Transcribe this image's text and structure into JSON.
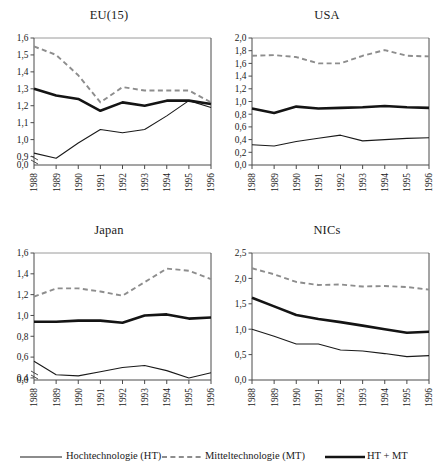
{
  "figure": {
    "panel_count": 4,
    "legend": {
      "position": "bottom",
      "entries": [
        {
          "key": "ht",
          "label": "Hochtechnologie (HT)",
          "style": "thin-solid-black",
          "color": "#1a1a1a"
        },
        {
          "key": "mt",
          "label": "Mitteltechnologie (MT)",
          "style": "dashed-grey",
          "color": "#8d8d8d"
        },
        {
          "key": "sum",
          "label": "HT + MT",
          "style": "thick-solid-black",
          "color": "#141414"
        }
      ]
    }
  },
  "chart_data": [
    {
      "type": "line",
      "title": "EU(15)",
      "xlabel": "",
      "ylabel": "",
      "x": [
        1988,
        1989,
        1990,
        1991,
        1992,
        1993,
        1994,
        1995,
        1996
      ],
      "xticklabels": [
        "1988",
        "1989",
        "1990",
        "1991",
        "1992",
        "1993",
        "1994",
        "1995",
        "1996"
      ],
      "yticklabels": [
        "0,0",
        "0,9",
        "1,0",
        "1,1",
        "1,2",
        "1,3",
        "1,4",
        "1,5",
        "1,6"
      ],
      "ytickvalues": [
        0.0,
        0.9,
        1.0,
        1.1,
        1.2,
        1.3,
        1.4,
        1.5,
        1.6
      ],
      "ylim": [
        0.85,
        1.6
      ],
      "axis_break": true,
      "grid": false,
      "series": [
        {
          "name": "Hochtechnologie (HT)",
          "key": "ht",
          "values": [
            0.92,
            0.89,
            0.98,
            1.06,
            1.04,
            1.06,
            1.14,
            1.23,
            1.19
          ]
        },
        {
          "name": "Mitteltechnologie (MT)",
          "key": "mt",
          "values": [
            1.55,
            1.5,
            1.38,
            1.22,
            1.31,
            1.29,
            1.29,
            1.29,
            1.22
          ]
        },
        {
          "name": "HT + MT",
          "key": "sum",
          "values": [
            1.3,
            1.26,
            1.24,
            1.17,
            1.22,
            1.2,
            1.23,
            1.23,
            1.21
          ]
        }
      ]
    },
    {
      "type": "line",
      "title": "USA",
      "xlabel": "",
      "ylabel": "",
      "x": [
        1988,
        1989,
        1990,
        1991,
        1992,
        1993,
        1994,
        1995,
        1996
      ],
      "xticklabels": [
        "1988",
        "1989",
        "1990",
        "1991",
        "1992",
        "1993",
        "1994",
        "1995",
        "1996"
      ],
      "yticklabels": [
        "0,0",
        "0,2",
        "0,4",
        "0,6",
        "0,8",
        "1,0",
        "1,2",
        "1,4",
        "1,6",
        "1,8",
        "2,0"
      ],
      "ytickvalues": [
        0.0,
        0.2,
        0.4,
        0.6,
        0.8,
        1.0,
        1.2,
        1.4,
        1.6,
        1.8,
        2.0
      ],
      "ylim": [
        0.0,
        2.0
      ],
      "axis_break": false,
      "grid": false,
      "series": [
        {
          "name": "Hochtechnologie (HT)",
          "key": "ht",
          "values": [
            0.32,
            0.3,
            0.37,
            0.42,
            0.47,
            0.38,
            0.4,
            0.42,
            0.43
          ]
        },
        {
          "name": "Mitteltechnologie (MT)",
          "key": "mt",
          "values": [
            1.72,
            1.73,
            1.7,
            1.6,
            1.6,
            1.72,
            1.81,
            1.72,
            1.71
          ]
        },
        {
          "name": "HT + MT",
          "key": "sum",
          "values": [
            0.89,
            0.82,
            0.92,
            0.89,
            0.9,
            0.91,
            0.93,
            0.91,
            0.9
          ]
        }
      ]
    },
    {
      "type": "line",
      "title": "Japan",
      "xlabel": "",
      "ylabel": "",
      "x": [
        1988,
        1989,
        1990,
        1991,
        1992,
        1993,
        1994,
        1995,
        1996
      ],
      "xticklabels": [
        "1988",
        "1989",
        "1990",
        "1991",
        "1992",
        "1993",
        "1994",
        "1995",
        "1996"
      ],
      "yticklabels": [
        "0,0",
        "0,4",
        "0,6",
        "0,8",
        "1,0",
        "1,2",
        "1,4",
        "1,6"
      ],
      "ytickvalues": [
        0.0,
        0.4,
        0.6,
        0.8,
        1.0,
        1.2,
        1.4,
        1.6
      ],
      "ylim": [
        0.38,
        1.6
      ],
      "axis_break": true,
      "grid": false,
      "series": [
        {
          "name": "Hochtechnologie (HT)",
          "key": "ht",
          "values": [
            0.56,
            0.43,
            0.42,
            0.46,
            0.5,
            0.52,
            0.47,
            0.4,
            0.45
          ]
        },
        {
          "name": "Mitteltechnologie (MT)",
          "key": "mt",
          "values": [
            1.18,
            1.26,
            1.26,
            1.23,
            1.19,
            1.32,
            1.45,
            1.43,
            1.35
          ]
        },
        {
          "name": "HT + MT",
          "key": "sum",
          "values": [
            0.94,
            0.94,
            0.95,
            0.95,
            0.93,
            1.0,
            1.01,
            0.97,
            0.98
          ]
        }
      ]
    },
    {
      "type": "line",
      "title": "NICs",
      "xlabel": "",
      "ylabel": "",
      "x": [
        1988,
        1989,
        1990,
        1991,
        1992,
        1993,
        1994,
        1995,
        1996
      ],
      "xticklabels": [
        "1988",
        "1989",
        "1990",
        "1991",
        "1992",
        "1993",
        "1994",
        "1995",
        "1996"
      ],
      "yticklabels": [
        "0,0",
        "0,5",
        "1,0",
        "1,5",
        "2,0",
        "2,5"
      ],
      "ytickvalues": [
        0.0,
        0.5,
        1.0,
        1.5,
        2.0,
        2.5
      ],
      "ylim": [
        0.0,
        2.5
      ],
      "axis_break": false,
      "grid": false,
      "series": [
        {
          "name": "Hochtechnologie (HT)",
          "key": "ht",
          "values": [
            1.0,
            0.86,
            0.71,
            0.71,
            0.59,
            0.57,
            0.52,
            0.46,
            0.48
          ]
        },
        {
          "name": "Mitteltechnologie (MT)",
          "key": "mt",
          "values": [
            2.2,
            2.08,
            1.93,
            1.87,
            1.88,
            1.84,
            1.85,
            1.83,
            1.78
          ]
        },
        {
          "name": "HT + MT",
          "key": "sum",
          "values": [
            1.62,
            1.45,
            1.28,
            1.2,
            1.14,
            1.07,
            1.0,
            0.93,
            0.95
          ]
        }
      ]
    }
  ]
}
